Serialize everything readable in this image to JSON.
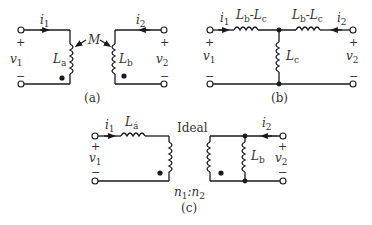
{
  "panels": {
    "a": {
      "caption": "(a)",
      "current_left": {
        "sym": "i",
        "sub": "1"
      },
      "current_right": {
        "sym": "i",
        "sub": "2"
      },
      "voltage_left": {
        "sym": "v",
        "sub": "1"
      },
      "voltage_right": {
        "sym": "v",
        "sub": "2"
      },
      "inductor_left": {
        "sym": "L",
        "sub": "a"
      },
      "inductor_right": {
        "sym": "L",
        "sub": "b"
      },
      "mutual": "M",
      "plus": "+",
      "minus": "−"
    },
    "b": {
      "caption": "(b)",
      "current_left": {
        "sym": "i",
        "sub": "1"
      },
      "current_right": {
        "sym": "i",
        "sub": "2"
      },
      "voltage_left": {
        "sym": "v",
        "sub": "1"
      },
      "voltage_right": {
        "sym": "v",
        "sub": "2"
      },
      "series_left": {
        "a": "L",
        "asub": "b",
        "dash": "-",
        "b": "L",
        "bsub": "c"
      },
      "series_right": {
        "a": "L",
        "asub": "b",
        "dash": "-",
        "b": "L",
        "bsub": "c"
      },
      "shunt": {
        "sym": "L",
        "sub": "c"
      },
      "plus": "+",
      "minus": "−"
    },
    "c": {
      "caption": "(c)",
      "current_left": {
        "sym": "i",
        "sub": "1"
      },
      "current_right": {
        "sym": "i",
        "sub": "2"
      },
      "voltage_left": {
        "sym": "v",
        "sub": "1"
      },
      "voltage_right": {
        "sym": "v",
        "sub": "2"
      },
      "series": {
        "sym": "L",
        "sub": "á"
      },
      "shunt": {
        "sym": "L",
        "sub": "b"
      },
      "transformer_label": "Ideal",
      "ratio": {
        "n1": "n",
        "n1sub": "1",
        "colon": ":",
        "n2": "n",
        "n2sub": "2"
      },
      "plus": "+",
      "minus": "−"
    }
  }
}
